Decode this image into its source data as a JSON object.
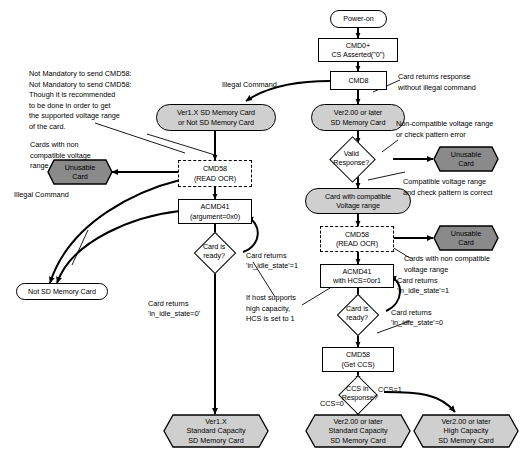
{
  "diagram": {
    "colors": {
      "shape_fill_light": "#cfcfcf",
      "shape_fill_dark": "#8a8a8a",
      "shape_fill_white": "#ffffff",
      "stroke": "#000000"
    },
    "nodes": [
      {
        "id": "power_on",
        "shape": "terminator",
        "label": "Power-on"
      },
      {
        "id": "cmd0",
        "shape": "process",
        "label": "CMD0+\nCS Asserted(\"0\")"
      },
      {
        "id": "cmd8",
        "shape": "process",
        "label": "CMD8"
      },
      {
        "id": "ver1x_card",
        "shape": "terminator",
        "label": "Ver1.X SD Memory Card\nor Not SD Memory Card"
      },
      {
        "id": "ver2_card",
        "shape": "terminator",
        "label": "Ver2.00 or later\nSD Memory Card"
      },
      {
        "id": "valid_response",
        "shape": "decision",
        "label": "Valid\nResponse?"
      },
      {
        "id": "unusable_1",
        "shape": "hexagon",
        "label": "Unusable\nCard"
      },
      {
        "id": "card_compatible",
        "shape": "terminator",
        "label": "Card with compatible\nVoltage range"
      },
      {
        "id": "cmd58_left",
        "shape": "process-dashed",
        "label": "CMD58\n(READ OCR)"
      },
      {
        "id": "cmd58_right",
        "shape": "process-dashed",
        "label": "CMD58\n(READ OCR)"
      },
      {
        "id": "unusable_2",
        "shape": "hexagon",
        "label": "Unusable\nCard"
      },
      {
        "id": "unusable_3",
        "shape": "hexagon",
        "label": "Unusable\nCard"
      },
      {
        "id": "acmd41_left",
        "shape": "process",
        "label": "ACMD41\n(argument=0x0)"
      },
      {
        "id": "acmd41_right",
        "shape": "process",
        "label": "ACMD41\nwith HCS=0or1"
      },
      {
        "id": "card_ready_left",
        "shape": "decision",
        "label": "Card is\nready?"
      },
      {
        "id": "card_ready_right",
        "shape": "decision",
        "label": "Card is\nready?"
      },
      {
        "id": "not_sd_card",
        "shape": "terminator",
        "label": "Not SD Memory Card"
      },
      {
        "id": "cmd58_getccs",
        "shape": "process",
        "label": "CMD58\n(Get CCS)"
      },
      {
        "id": "ccs_in_response",
        "shape": "decision",
        "label": "CCS in\nResponse?"
      },
      {
        "id": "ver1x_std",
        "shape": "hexagon",
        "label": "Ver1.X\nStandard Capacity\nSD Memory Card"
      },
      {
        "id": "ver2_std",
        "shape": "hexagon",
        "label": "Ver2.00 or later\nStandard Capacity\nSD Memory Card"
      },
      {
        "id": "ver2_high",
        "shape": "hexagon",
        "label": "Ver2.00 or later\nHigh Capacity\nSD Memory Card"
      }
    ],
    "notes": {
      "cmd58_note": "Not Mandatory to send CMD58:\nNot Mandatory to send CMD58:\nThough it is recommended\nto be done in order to get\nthe supported voltage range\nof the card.",
      "cards_non_compat_left": "Cards with non\ncompatible voltage\nrange",
      "cards_non_compat_right": "Cards with non compatible\nvoltage range",
      "card_returns_response": "Card returns response\nwithout illegal command",
      "non_compatible_or_pattern_error": "Non-compatible voltage range\nor check pattern error",
      "compatible_and_pattern_correct": "Compatible voltage range\nand check pattern is correct",
      "host_supports_high_capacity": "If host supports\nhigh capacity,\nHCS is set to 1"
    },
    "edge_labels": {
      "illegal_command_top": "Illegal Command",
      "illegal_command_left": "Illegal Command",
      "card_returns_idle1_left": "Card returns\n'in_idle_state'=1",
      "card_returns_idle0_left": "Card returns\n'in_idle_state=0'",
      "card_returns_idle1_right": "Card returns\n'in_idle_state'=1",
      "card_returns_idle0_right": "Card returns\n'in_idle_state'=0",
      "ccs_zero": "CCS=0",
      "ccs_one": "CCS=1"
    }
  }
}
